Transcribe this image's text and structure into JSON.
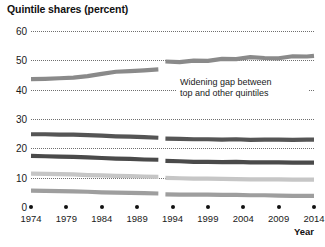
{
  "chart_data": {
    "type": "line",
    "title": "Quintile shares (percent)",
    "xlabel": "Year",
    "ylabel": "",
    "xlim": [
      1974,
      2014
    ],
    "ylim": [
      0,
      60
    ],
    "yticks": [
      0,
      10,
      20,
      30,
      40,
      50,
      60
    ],
    "xticks": [
      1974,
      1979,
      1984,
      1989,
      1994,
      1999,
      2004,
      2009,
      2014
    ],
    "grid": true,
    "legend_position": "none",
    "break_at_year": 1992.5,
    "annotations": [
      {
        "name": "widening-gap-note",
        "lines": [
          "Widening gap between",
          "top and other quintiles"
        ],
        "x": 1996,
        "y": 38
      }
    ],
    "series": [
      {
        "name": "Top quintile",
        "color": "#8a8a8a",
        "x": [
          1974,
          1976,
          1978,
          1980,
          1982,
          1984,
          1986,
          1988,
          1990,
          1992,
          1993,
          1995,
          1997,
          1999,
          2001,
          2003,
          2005,
          2007,
          2009,
          2011,
          2013,
          2014
        ],
        "values": [
          43.6,
          43.7,
          43.9,
          44.1,
          44.6,
          45.4,
          46.1,
          46.3,
          46.6,
          46.9,
          49.6,
          49.4,
          49.9,
          49.8,
          50.5,
          50.4,
          51.1,
          50.8,
          50.7,
          51.4,
          51.3,
          51.5
        ]
      },
      {
        "name": "Fourth quintile",
        "color": "#555555",
        "x": [
          1974,
          1976,
          1978,
          1980,
          1982,
          1984,
          1986,
          1988,
          1990,
          1992,
          1993,
          1995,
          1997,
          1999,
          2001,
          2003,
          2005,
          2007,
          2009,
          2011,
          2013,
          2014
        ],
        "values": [
          24.8,
          24.8,
          24.7,
          24.7,
          24.5,
          24.3,
          24.1,
          24.0,
          23.8,
          23.6,
          23.3,
          23.2,
          23.1,
          23.1,
          23.0,
          23.1,
          22.9,
          23.0,
          23.0,
          22.9,
          23.0,
          23.0
        ]
      },
      {
        "name": "Third quintile",
        "color": "#4a4a4a",
        "x": [
          1974,
          1976,
          1978,
          1980,
          1982,
          1984,
          1986,
          1988,
          1990,
          1992,
          1993,
          1995,
          1997,
          1999,
          2001,
          2003,
          2005,
          2007,
          2009,
          2011,
          2013,
          2014
        ],
        "values": [
          17.4,
          17.3,
          17.2,
          17.1,
          16.9,
          16.7,
          16.5,
          16.4,
          16.2,
          16.1,
          15.7,
          15.6,
          15.4,
          15.4,
          15.3,
          15.4,
          15.2,
          15.2,
          15.2,
          15.1,
          15.1,
          15.1
        ]
      },
      {
        "name": "Second quintile",
        "color": "#c6c6c6",
        "x": [
          1974,
          1976,
          1978,
          1980,
          1982,
          1984,
          1986,
          1988,
          1990,
          1992,
          1993,
          1995,
          1997,
          1999,
          2001,
          2003,
          2005,
          2007,
          2009,
          2011,
          2013,
          2014
        ],
        "values": [
          11.4,
          11.3,
          11.2,
          11.1,
          10.9,
          10.8,
          10.6,
          10.5,
          10.4,
          10.3,
          9.9,
          9.8,
          9.7,
          9.7,
          9.6,
          9.5,
          9.4,
          9.4,
          9.4,
          9.3,
          9.3,
          9.3
        ]
      },
      {
        "name": "Bottom quintile",
        "color": "#9e9e9e",
        "x": [
          1974,
          1976,
          1978,
          1980,
          1982,
          1984,
          1986,
          1988,
          1990,
          1992,
          1993,
          1995,
          1997,
          1999,
          2001,
          2003,
          2005,
          2007,
          2009,
          2011,
          2013,
          2014
        ],
        "values": [
          5.6,
          5.5,
          5.4,
          5.3,
          5.2,
          5.0,
          4.9,
          4.8,
          4.7,
          4.6,
          4.3,
          4.2,
          4.2,
          4.2,
          4.1,
          4.1,
          4.0,
          4.0,
          3.9,
          3.8,
          3.8,
          3.8
        ]
      }
    ]
  }
}
